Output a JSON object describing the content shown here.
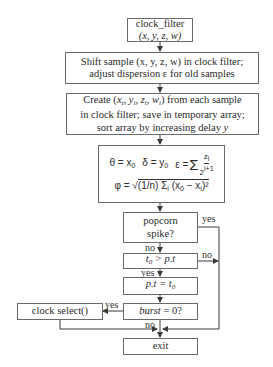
{
  "nodes": {
    "start": {
      "line1": "clock_filter",
      "line2": "(x, y, z, w)"
    },
    "shift": {
      "line1": "Shift sample (x, y, z, w) in clock filter;",
      "line2": "adjust dispersion ε for old samples"
    },
    "create": {
      "line1": "Create (xi, yi, zi, wi) from each sample",
      "line2": "in clock filter; save in temporary array;",
      "line3": "sort array by increasing delay y"
    },
    "compute": {
      "theta": "θ = x0",
      "delta": "δ = y0",
      "epsilon": "ε = Σi zi / 2^(i+1)",
      "phi": "φ = √( (1/n) Σi (x0 − xi)² )"
    },
    "popcorn": {
      "line1": "popcorn",
      "line2": "spike?"
    },
    "t0_check": {
      "text": "t0 > p.t"
    },
    "assign": {
      "text": "p.t = t0"
    },
    "burst": {
      "text": "burst = 0?"
    },
    "clock_select": {
      "text": "clock select()"
    },
    "exit": {
      "text": "exit"
    }
  },
  "edge_labels": {
    "popcorn_yes": "yes",
    "popcorn_no": "no",
    "t0_no": "no",
    "t0_yes": "yes",
    "burst_yes": "yes",
    "burst_no": "no"
  },
  "colors": {
    "line": "#3a3a3a",
    "border": "#6a6a6a"
  }
}
